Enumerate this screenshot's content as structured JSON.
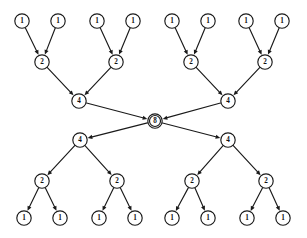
{
  "diagram": {
    "background_color": "#ffffff",
    "stroke_color": "#1a1a1a",
    "node_fill_color": "#ffffff",
    "width": 307,
    "height": 238,
    "node_radius": 7.2,
    "root_radius": 7.2,
    "arrow_size": 4.6,
    "nodes": [
      {
        "id": "t1a",
        "label": "1",
        "x": 22,
        "y": 21,
        "level": "leaf-top",
        "r": 7.2
      },
      {
        "id": "t1b",
        "label": "1",
        "x": 58,
        "y": 21,
        "level": "leaf-top",
        "r": 7.2
      },
      {
        "id": "t1c",
        "label": "1",
        "x": 97,
        "y": 21,
        "level": "leaf-top",
        "r": 7.2
      },
      {
        "id": "t1d",
        "label": "1",
        "x": 133,
        "y": 21,
        "level": "leaf-top",
        "r": 7.2
      },
      {
        "id": "t1e",
        "label": "1",
        "x": 172,
        "y": 21,
        "level": "leaf-top",
        "r": 7.2
      },
      {
        "id": "t1f",
        "label": "1",
        "x": 208,
        "y": 21,
        "level": "leaf-top",
        "r": 7.2
      },
      {
        "id": "t1g",
        "label": "1",
        "x": 246,
        "y": 21,
        "level": "leaf-top",
        "r": 7.2
      },
      {
        "id": "t1h",
        "label": "1",
        "x": 282,
        "y": 21,
        "level": "leaf-top",
        "r": 7.2
      },
      {
        "id": "t2a",
        "label": "2",
        "x": 42,
        "y": 62,
        "level": "mid-top",
        "r": 7.2
      },
      {
        "id": "t2b",
        "label": "2",
        "x": 116,
        "y": 62,
        "level": "mid-top",
        "r": 7.2
      },
      {
        "id": "t2c",
        "label": "2",
        "x": 191,
        "y": 62,
        "level": "mid-top",
        "r": 7.2
      },
      {
        "id": "t2d",
        "label": "2",
        "x": 265,
        "y": 62,
        "level": "mid-top",
        "r": 7.2
      },
      {
        "id": "t4a",
        "label": "4",
        "x": 79,
        "y": 101,
        "level": "upper-top",
        "r": 7.2
      },
      {
        "id": "t4b",
        "label": "4",
        "x": 228,
        "y": 101,
        "level": "upper-top",
        "r": 7.2
      },
      {
        "id": "root",
        "label": "8",
        "x": 155,
        "y": 121,
        "level": "root",
        "r": 7.2
      },
      {
        "id": "b4a",
        "label": "4",
        "x": 80,
        "y": 140,
        "level": "upper-bot",
        "r": 7.2
      },
      {
        "id": "b4b",
        "label": "4",
        "x": 228,
        "y": 140,
        "level": "upper-bot",
        "r": 7.2
      },
      {
        "id": "b2a",
        "label": "2",
        "x": 42,
        "y": 181,
        "level": "mid-bot",
        "r": 7.2
      },
      {
        "id": "b2b",
        "label": "2",
        "x": 117,
        "y": 181,
        "level": "mid-bot",
        "r": 7.2
      },
      {
        "id": "b2c",
        "label": "2",
        "x": 192,
        "y": 181,
        "level": "mid-bot",
        "r": 7.2
      },
      {
        "id": "b2d",
        "label": "2",
        "x": 266,
        "y": 181,
        "level": "mid-bot",
        "r": 7.2
      },
      {
        "id": "b1a",
        "label": "1",
        "x": 24,
        "y": 218,
        "level": "leaf-bot",
        "r": 7.2
      },
      {
        "id": "b1b",
        "label": "1",
        "x": 60,
        "y": 218,
        "level": "leaf-bot",
        "r": 7.2
      },
      {
        "id": "b1c",
        "label": "1",
        "x": 99,
        "y": 218,
        "level": "leaf-bot",
        "r": 7.2
      },
      {
        "id": "b1d",
        "label": "1",
        "x": 135,
        "y": 218,
        "level": "leaf-bot",
        "r": 7.2
      },
      {
        "id": "b1e",
        "label": "1",
        "x": 172,
        "y": 218,
        "level": "leaf-bot",
        "r": 7.2
      },
      {
        "id": "b1f",
        "label": "1",
        "x": 208,
        "y": 218,
        "level": "leaf-bot",
        "r": 7.2
      },
      {
        "id": "b1g",
        "label": "1",
        "x": 247,
        "y": 218,
        "level": "leaf-bot",
        "r": 7.2
      },
      {
        "id": "b1h",
        "label": "1",
        "x": 283,
        "y": 218,
        "level": "leaf-bot",
        "r": 7.2
      }
    ],
    "edges": [
      {
        "from": "t1a",
        "to": "t2a",
        "direction": "up-to-mid"
      },
      {
        "from": "t1b",
        "to": "t2a",
        "direction": "up-to-mid"
      },
      {
        "from": "t1c",
        "to": "t2b",
        "direction": "up-to-mid"
      },
      {
        "from": "t1d",
        "to": "t2b",
        "direction": "up-to-mid"
      },
      {
        "from": "t1e",
        "to": "t2c",
        "direction": "up-to-mid"
      },
      {
        "from": "t1f",
        "to": "t2c",
        "direction": "up-to-mid"
      },
      {
        "from": "t1g",
        "to": "t2d",
        "direction": "up-to-mid"
      },
      {
        "from": "t1h",
        "to": "t2d",
        "direction": "up-to-mid"
      },
      {
        "from": "t2a",
        "to": "t4a",
        "direction": "mid-to-upper"
      },
      {
        "from": "t2b",
        "to": "t4a",
        "direction": "mid-to-upper"
      },
      {
        "from": "t2c",
        "to": "t4b",
        "direction": "mid-to-upper"
      },
      {
        "from": "t2d",
        "to": "t4b",
        "direction": "mid-to-upper"
      },
      {
        "from": "t4a",
        "to": "root",
        "direction": "upper-to-root"
      },
      {
        "from": "t4b",
        "to": "root",
        "direction": "upper-to-root"
      },
      {
        "from": "root",
        "to": "b4a",
        "direction": "root-to-upper"
      },
      {
        "from": "root",
        "to": "b4b",
        "direction": "root-to-upper"
      },
      {
        "from": "b4a",
        "to": "b2a",
        "direction": "upper-to-mid"
      },
      {
        "from": "b4a",
        "to": "b2b",
        "direction": "upper-to-mid"
      },
      {
        "from": "b4b",
        "to": "b2c",
        "direction": "upper-to-mid"
      },
      {
        "from": "b4b",
        "to": "b2d",
        "direction": "upper-to-mid"
      },
      {
        "from": "b2a",
        "to": "b1a",
        "direction": "mid-to-leaf"
      },
      {
        "from": "b2a",
        "to": "b1b",
        "direction": "mid-to-leaf"
      },
      {
        "from": "b2b",
        "to": "b1c",
        "direction": "mid-to-leaf"
      },
      {
        "from": "b2b",
        "to": "b1d",
        "direction": "mid-to-leaf"
      },
      {
        "from": "b2c",
        "to": "b1e",
        "direction": "mid-to-leaf"
      },
      {
        "from": "b2c",
        "to": "b1f",
        "direction": "mid-to-leaf"
      },
      {
        "from": "b2d",
        "to": "b1g",
        "direction": "mid-to-leaf"
      },
      {
        "from": "b2d",
        "to": "b1h",
        "direction": "mid-to-leaf"
      }
    ]
  }
}
